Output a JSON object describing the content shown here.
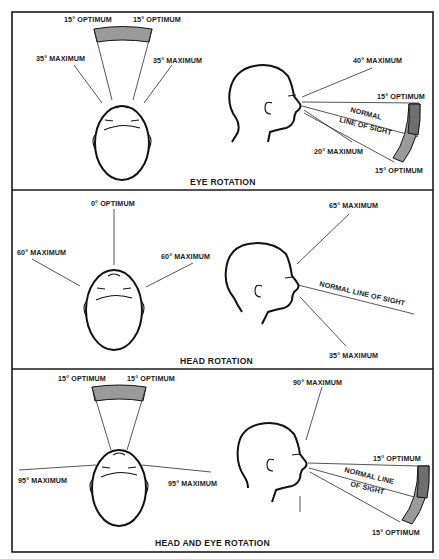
{
  "colors": {
    "ink": "#1a1a1a",
    "band_fill": "#9a9a9a",
    "band_fill_dark": "#6f6f6f",
    "background": "#ffffff"
  },
  "panels": [
    {
      "caption": "EYE ROTATION",
      "top_view": {
        "labels": [
          "15° OPTIMUM",
          "15° OPTIMUM",
          "35° MAXIMUM",
          "35° MAXIMUM"
        ]
      },
      "side_view": {
        "labels": [
          "40° MAXIMUM",
          "15° OPTIMUM",
          "NORMAL",
          "LINE OF SIGHT",
          "20° MAXIMUM",
          "15° OPTIMUM"
        ]
      }
    },
    {
      "caption": "HEAD ROTATION",
      "top_view": {
        "labels": [
          "0° OPTIMUM",
          "60° MAXIMUM",
          "60° MAXIMUM"
        ]
      },
      "side_view": {
        "labels": [
          "65° MAXIMUM",
          "NORMAL LINE OF SIGHT",
          "35° MAXIMUM"
        ]
      }
    },
    {
      "caption": "HEAD AND EYE ROTATION",
      "top_view": {
        "labels": [
          "15° OPTIMUM",
          "15° OPTIMUM",
          "95° MAXIMUM",
          "95° MAXIMUM"
        ]
      },
      "side_view": {
        "labels": [
          "90° MAXIMUM",
          "15° OPTIMUM",
          "NORMAL LINE",
          "OF SIGHT",
          "15° OPTIMUM"
        ]
      }
    }
  ]
}
